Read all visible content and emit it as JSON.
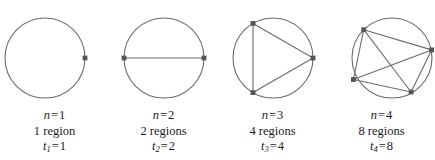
{
  "figure": {
    "kind": "math-diagram",
    "background_color": "#ffffff",
    "stroke_color": "#6b6b6b",
    "point_color": "#555555",
    "text_color": "#1b1b1b"
  },
  "panels": [
    {
      "id": "panel-1",
      "n_label": "n",
      "n_equals": "=",
      "n_value": "1",
      "regions_text": "1 region",
      "t_label": "t",
      "t_subscript": "1",
      "t_equals": "=",
      "t_value": "1",
      "points": 1,
      "chords": 0,
      "regions": 1
    },
    {
      "id": "panel-2",
      "n_label": "n",
      "n_equals": "=",
      "n_value": "2",
      "regions_text": "2 regions",
      "t_label": "t",
      "t_subscript": "2",
      "t_equals": "=",
      "t_value": "2",
      "points": 2,
      "chords": 1,
      "regions": 2
    },
    {
      "id": "panel-3",
      "n_label": "n",
      "n_equals": "=",
      "n_value": "3",
      "regions_text": "4 regions",
      "t_label": "t",
      "t_subscript": "3",
      "t_equals": "=",
      "t_value": "4",
      "points": 3,
      "chords": 3,
      "regions": 4
    },
    {
      "id": "panel-4",
      "n_label": "n",
      "n_equals": "=",
      "n_value": "4",
      "regions_text": "8 regions",
      "t_label": "t",
      "t_subscript": "4",
      "t_equals": "=",
      "t_value": "8",
      "points": 4,
      "chords": 6,
      "regions": 8
    }
  ]
}
